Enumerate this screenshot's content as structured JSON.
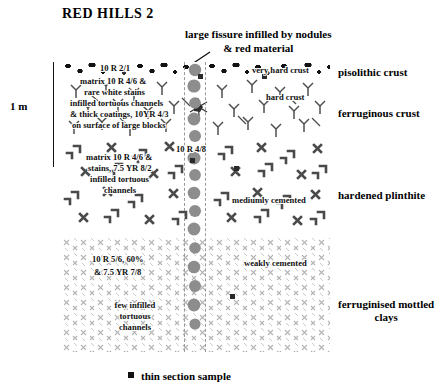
{
  "title": "RED HILLS 2",
  "scale": {
    "label": "1 m"
  },
  "callout": {
    "line1": "large fissure infilled by nodules",
    "line2": "& red material"
  },
  "horizons": [
    {
      "name": "pisolithic crust",
      "key": "pisolithic"
    },
    {
      "name": "ferruginous crust",
      "key": "ferruginous"
    },
    {
      "name": "hardened plinthite",
      "key": "plinthite"
    },
    {
      "name": "ferruginised mottled",
      "key": "clays",
      "name2": "clays"
    }
  ],
  "annotations": {
    "munsell_top": "10 R 2/1",
    "matrix_top": "matrix 10 R 4/6 &",
    "white_stains": "rare white stains",
    "infilled_top": "infilled  tortuous channels",
    "coatings": "& thick coatings, 10YR 4/3",
    "blocks": "on surface of large blocks",
    "very_hard_crust": "very hard crust",
    "hard_crust": "hard crust",
    "fissure_munsell": "10 R 4/8",
    "matrix_mid": "matrix 10 R 4/6 &",
    "stains_mid": "stains, 7.5 YR 8/2",
    "infilled_mid1": "infilled tortuous",
    "infilled_mid2": "channels",
    "medium_cemented": "mediumly cemented",
    "weakly_cemented": "weakly cemented",
    "munsell_low1": "10 R 5/6, 60%",
    "munsell_low2": "& 7.5 YR 7/8",
    "few_infilled1": "few infilled",
    "few_infilled2": "tortuous",
    "few_infilled3": "channels"
  },
  "legend": {
    "label": "thin section sample",
    "marker": "filled-square"
  },
  "colors": {
    "ink": "#111111",
    "nodule_grey": "#8a8a8a",
    "hatch_dark": "#555555",
    "hatch_light": "#b9b9b9",
    "page": "#ffffff"
  }
}
